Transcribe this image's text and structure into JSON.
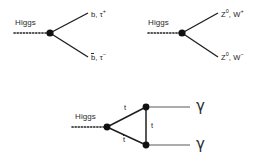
{
  "figure": {
    "background": "#ffffff",
    "line_color": "#1f1f1f",
    "text_color": "#222222"
  },
  "diagrams": [
    {
      "id": "higgs-to-fermions",
      "incoming_label": "Higgs",
      "incoming_style": "dotted",
      "vertex": {
        "x": 50,
        "y": 33
      },
      "outgoing": [
        {
          "label_base": "b",
          "label_overbar": false,
          "partner": "τ",
          "charge": "+",
          "text": "b, τ⁺",
          "direction": "up"
        },
        {
          "label_base": "b",
          "label_overbar": true,
          "partner": "τ",
          "charge": "−",
          "text": "b̄, τ⁻",
          "direction": "down"
        }
      ]
    },
    {
      "id": "higgs-to-bosons",
      "incoming_label": "Higgs",
      "incoming_style": "dotted",
      "vertex": {
        "x": 182,
        "y": 33
      },
      "outgoing": [
        {
          "label_base": "Z",
          "superscript": "0",
          "partner": "W",
          "charge": "+",
          "text": "Z⁰, W⁺",
          "direction": "up"
        },
        {
          "label_base": "Z",
          "superscript": "0",
          "partner": "W",
          "charge": "−",
          "text": "Z⁰, W⁻",
          "direction": "down"
        }
      ]
    },
    {
      "id": "higgs-to-diphoton-top-loop",
      "incoming_label": "Higgs",
      "incoming_style": "dotted",
      "vertex": {
        "x": 107,
        "y": 127
      },
      "loop_vertices": [
        {
          "x": 146,
          "y": 107
        },
        {
          "x": 146,
          "y": 145
        }
      ],
      "loop_labels": [
        {
          "text": "t",
          "position": "top"
        },
        {
          "text": "t̄",
          "position": "bottom"
        },
        {
          "text": "t",
          "position": "right"
        }
      ],
      "outgoing": [
        {
          "text": "γ",
          "direction": "up"
        },
        {
          "text": "γ",
          "direction": "down"
        }
      ]
    }
  ],
  "labels": {
    "higgs": "Higgs",
    "b": "b",
    "tau_plus": "τ",
    "tau_minus": "τ",
    "plus": "+",
    "minus": "−",
    "z_boson": "Z",
    "z_super": "0",
    "w_boson": "W",
    "top": "t",
    "photon": "γ",
    "d1_up_text": "b, τ",
    "d1_down_text": ", τ",
    "d1_down_base": "b",
    "d2_up_prefix": "Z",
    "d2_up_mid": ", W",
    "d2_down_prefix": "Z",
    "d2_down_mid": ", W"
  }
}
